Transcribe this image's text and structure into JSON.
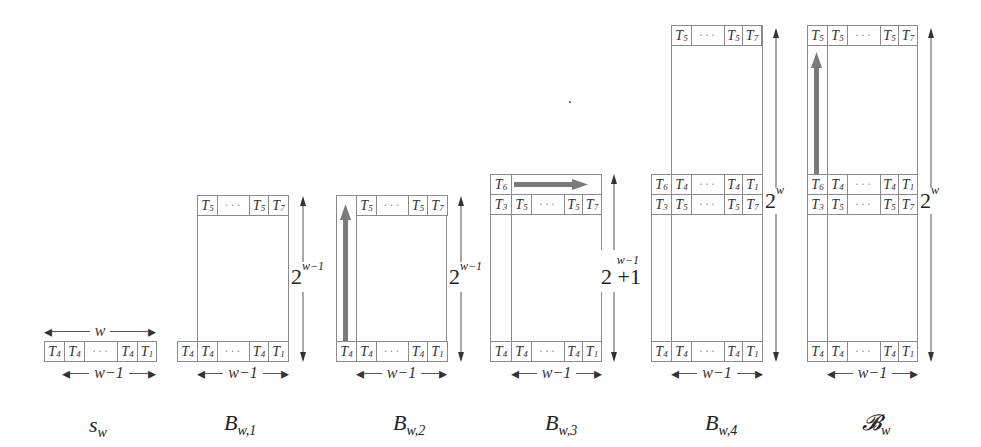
{
  "diagram": {
    "panels": [
      {
        "id": "sw",
        "caption": "s",
        "caption_sub": "w",
        "width_label": "w",
        "bottom_label": "w−1",
        "rows": [
          [
            "T4",
            "T4",
            "···",
            "T4",
            "T1"
          ]
        ]
      },
      {
        "id": "bw1",
        "caption": "B",
        "caption_sub": "w,1",
        "bottom_label": "w−1",
        "height_label": "2",
        "height_sup": "w−1",
        "top_row": [
          "T5",
          "···",
          "T5",
          "T7"
        ],
        "bottom_row": [
          "T4",
          "T4",
          "···",
          "T4",
          "T1"
        ]
      },
      {
        "id": "bw2",
        "caption": "B",
        "caption_sub": "w,2",
        "bottom_label": "w−1",
        "height_label": "2",
        "height_sup": "w−1",
        "arrow": "vertical-up",
        "top_row": [
          "T5",
          "···",
          "T5",
          "T7"
        ],
        "bottom_row": [
          "T4",
          "T4",
          "···",
          "T4",
          "T1"
        ]
      },
      {
        "id": "bw3",
        "caption": "B",
        "caption_sub": "w,3",
        "bottom_label": "w−1",
        "height_label": "2 +1",
        "height_sup": "w−1",
        "arrow": "horizontal-right",
        "top_row": [
          "T6"
        ],
        "second_row": [
          "T3",
          "T5",
          "···",
          "T5",
          "T7"
        ],
        "bottom_row": [
          "T4",
          "T4",
          "···",
          "T4",
          "T1"
        ]
      },
      {
        "id": "bw4",
        "caption": "B",
        "caption_sub": "w,4",
        "bottom_label": "w−1",
        "height_label": "2",
        "height_sup": "w",
        "top_row": [
          "T5",
          "···",
          "T5",
          "T7"
        ],
        "mid_row_a": [
          "T6",
          "T4",
          "···",
          "T4",
          "T1"
        ],
        "mid_row_b": [
          "T3",
          "T5",
          "···",
          "T5",
          "T7"
        ],
        "bottom_row": [
          "T4",
          "T4",
          "···",
          "T4",
          "T1"
        ]
      },
      {
        "id": "bw",
        "caption": "𝓑",
        "caption_sub": "w",
        "bottom_label": "w−1",
        "height_label": "2",
        "height_sup": "w",
        "arrow": "vertical-up",
        "top_row": [
          "T5",
          "T5",
          "···",
          "T5",
          "T7"
        ],
        "mid_row_a": [
          "T6",
          "T4",
          "···",
          "T4",
          "T1"
        ],
        "mid_row_b": [
          "T3",
          "T5",
          "···",
          "T5",
          "T7"
        ],
        "bottom_row": [
          "T4",
          "T4",
          "···",
          "T4",
          "T1"
        ]
      }
    ],
    "colors": {
      "arrow_fill": "#7a7a7a",
      "line": "#8a8a8a",
      "text": "#222222"
    }
  }
}
